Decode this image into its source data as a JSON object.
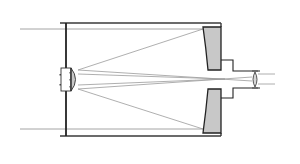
{
  "diagram": {
    "type": "optical-schematic",
    "labels": [],
    "colors": {
      "background": "#ffffff",
      "tube_outline": "#3a3a3a",
      "ray": "#9a9a9a",
      "mirror_fill": "#c8c8c8",
      "mirror_stroke": "#222222",
      "lens_fill": "#d6d6d6"
    },
    "components": [
      {
        "id": "tube",
        "name": "Telescope tube"
      },
      {
        "id": "corrector",
        "name": "Front corrector plate"
      },
      {
        "id": "secondary",
        "name": "Secondary mirror"
      },
      {
        "id": "primary-top",
        "name": "Primary mirror (upper half)"
      },
      {
        "id": "primary-bottom",
        "name": "Primary mirror (lower half)"
      },
      {
        "id": "baffle",
        "name": "Rear baffle / focuser tube"
      },
      {
        "id": "eyepiece",
        "name": "Eyepiece lens"
      },
      {
        "id": "rays",
        "name": "Light ray paths"
      }
    ]
  }
}
